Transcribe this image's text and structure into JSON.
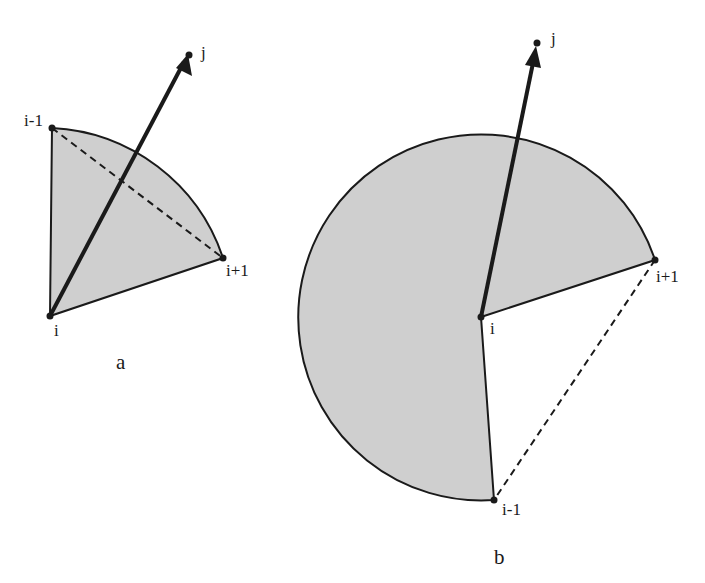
{
  "figure": {
    "colors": {
      "fill": "#cfcfcf",
      "stroke": "#1a1a1a",
      "background": "#ffffff"
    },
    "panels": [
      {
        "caption": "a",
        "labels": {
          "i": "i",
          "i_minus_1": "i-1",
          "i_plus_1": "i+1",
          "j": "j"
        }
      },
      {
        "caption": "b",
        "labels": {
          "i": "i",
          "i_minus_1": "i-1",
          "i_plus_1": "i+1",
          "j": "j"
        }
      }
    ]
  }
}
